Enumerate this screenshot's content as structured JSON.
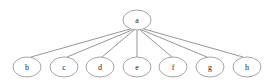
{
  "diagram": {
    "type": "tree",
    "background_color": "#ffffff",
    "node_fill_color": "#ffffff",
    "node_stroke_color": "#9a9a9a",
    "edge_color": "#8a8a8a",
    "label_color": "#1a1a1a",
    "node_rx": 14,
    "node_ry": 10,
    "root": {
      "id": "a",
      "label": "a",
      "cx": 137,
      "cy": 20
    },
    "leaves": [
      {
        "id": "b",
        "label": "b",
        "cx": 27,
        "cy": 67
      },
      {
        "id": "c",
        "label": "c",
        "cx": 64,
        "cy": 67
      },
      {
        "id": "d",
        "label": "d",
        "cx": 100,
        "cy": 67
      },
      {
        "id": "e",
        "label": "e",
        "cx": 137,
        "cy": 67
      },
      {
        "id": "f",
        "label": "f",
        "cx": 173,
        "cy": 67
      },
      {
        "id": "g",
        "label": "g",
        "cx": 210,
        "cy": 67
      },
      {
        "id": "h",
        "label": "h",
        "cx": 247,
        "cy": 67
      }
    ],
    "edges": [
      {
        "from": "a",
        "to": "b",
        "x1": 130,
        "y1": 29,
        "x2": 31,
        "y2": 57
      },
      {
        "from": "a",
        "to": "c",
        "x1": 132,
        "y1": 30,
        "x2": 67,
        "y2": 57
      },
      {
        "from": "a",
        "to": "d",
        "x1": 134,
        "y1": 30,
        "x2": 102,
        "y2": 57
      },
      {
        "from": "a",
        "to": "e",
        "x1": 137,
        "y1": 30,
        "x2": 137,
        "y2": 57
      },
      {
        "from": "a",
        "to": "f",
        "x1": 140,
        "y1": 30,
        "x2": 172,
        "y2": 57
      },
      {
        "from": "a",
        "to": "g",
        "x1": 142,
        "y1": 30,
        "x2": 207,
        "y2": 57
      },
      {
        "from": "a",
        "to": "h",
        "x1": 144,
        "y1": 29,
        "x2": 243,
        "y2": 57
      }
    ]
  }
}
